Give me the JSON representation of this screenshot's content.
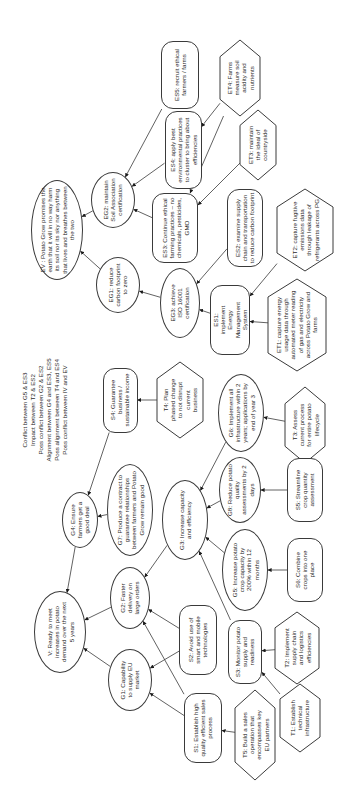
{
  "diagram": {
    "type": "goal-model",
    "orientation": "rotated-90-ccw",
    "nodes": [
      {
        "id": "EV",
        "shape": "ellipse",
        "text": "EV : Potato Grow promises the earth that it will in no way harm its soil nor its sky nor anything that lives and breathes between the two",
        "cx": 57,
        "cy": 230,
        "w": 52,
        "h": 100,
        "tw": 92
      },
      {
        "id": "EG2",
        "shape": "ellipse",
        "text": "EG2: maintain Soil Association certification",
        "cx": 113,
        "cy": 200,
        "w": 44,
        "h": 56,
        "tw": 48
      },
      {
        "id": "EG1",
        "shape": "ellipse",
        "text": "EG1: reduce carbon footprint to zero",
        "cx": 118,
        "cy": 285,
        "w": 44,
        "h": 56,
        "tw": 48
      },
      {
        "id": "ES5",
        "shape": "rrect",
        "text": "ES5: recruit ethical farmers / farms",
        "cx": 180,
        "cy": 75,
        "w": 38,
        "h": 68,
        "tw": 60
      },
      {
        "id": "ES4",
        "shape": "rrect",
        "text": "ES4: apply best environmental practices to cluster to bring about efficiencies",
        "cx": 183,
        "cy": 150,
        "w": 37,
        "h": 78,
        "tw": 70
      },
      {
        "id": "ES3",
        "shape": "rrect",
        "text": "ES3: Continue ethical farming practices – no chemicals, pesticides, GMO",
        "cx": 175,
        "cy": 228,
        "w": 46,
        "h": 70,
        "tw": 62
      },
      {
        "id": "ET4",
        "shape": "hex",
        "text": "ET4: Farms measure soil acidity and nutrients",
        "cx": 240,
        "cy": 78,
        "w": 40,
        "h": 76,
        "tw": 50
      },
      {
        "id": "ET3",
        "shape": "hex",
        "text": "ET3: maintain the ideal of countryside",
        "cx": 258,
        "cy": 145,
        "w": 36,
        "h": 70,
        "tw": 44
      },
      {
        "id": "ES2",
        "shape": "rrect",
        "text": "ES2: examine supply chain and transportation to reduce carbon footprint",
        "cx": 245,
        "cy": 228,
        "w": 36,
        "h": 78,
        "tw": 72
      },
      {
        "id": "ET2",
        "shape": "hex",
        "text": "ET2: capture fugitive emissions data through leakage of refrigerants across PG",
        "cx": 305,
        "cy": 230,
        "w": 56,
        "h": 82,
        "tw": 62
      },
      {
        "id": "EG3",
        "shape": "ellipse",
        "text": "EG3: achieve ISO 16001 certification",
        "cx": 180,
        "cy": 303,
        "w": 40,
        "h": 70,
        "tw": 40
      },
      {
        "id": "ES1",
        "shape": "rrect",
        "text": "ES1: implement Energy Management System",
        "cx": 230,
        "cy": 320,
        "w": 40,
        "h": 70,
        "tw": 40
      },
      {
        "id": "ET1",
        "shape": "hex",
        "text": "ET1: capture energy usage data through automated meter reading of gas and electricity across Potato Grow and farms",
        "cx": 297,
        "cy": 325,
        "w": 58,
        "h": 92,
        "tw": 72
      },
      {
        "id": "S4",
        "shape": "rrect",
        "text": "S4: Guarantee business / sustainable income",
        "cx": 120,
        "cy": 400,
        "w": 35,
        "h": 65,
        "tw": 58
      },
      {
        "id": "T4",
        "shape": "hex",
        "text": "T4: Plan phased change to not disrupt current business",
        "cx": 180,
        "cy": 400,
        "w": 46,
        "h": 76,
        "tw": 44
      },
      {
        "id": "G6",
        "shape": "ellipse",
        "text": "G6: Implement all infrastructure within 2 years; applications by end of year 3",
        "cx": 241,
        "cy": 413,
        "w": 46,
        "h": 78,
        "tw": 66
      },
      {
        "id": "T3",
        "shape": "hex",
        "text": "T3: Assess current process for entire potato lifecycle",
        "cx": 305,
        "cy": 425,
        "w": 40,
        "h": 76,
        "tw": 50
      },
      {
        "id": "G4",
        "shape": "ellipse",
        "text": "G4: Ensure farmers get a good deal",
        "cx": 80,
        "cy": 520,
        "w": 36,
        "h": 56,
        "tw": 38
      },
      {
        "id": "G7",
        "shape": "ellipse",
        "text": "G7: Produce a contract to guarantee relationships between farmers and Potato Grow remain good",
        "cx": 130,
        "cy": 510,
        "w": 46,
        "h": 92,
        "tw": 82
      },
      {
        "id": "G3",
        "shape": "ellipse",
        "text": "G3: Increase capacity and efficiency",
        "cx": 185,
        "cy": 520,
        "w": 46,
        "h": 80,
        "tw": 60
      },
      {
        "id": "G8",
        "shape": "ellipse",
        "text": "G8: Reduce potato quality assessments by 2 days",
        "cx": 240,
        "cy": 490,
        "w": 42,
        "h": 66,
        "tw": 52
      },
      {
        "id": "S5",
        "shape": "rrect",
        "text": "S5: Streamline crop quantity assessment",
        "cx": 305,
        "cy": 490,
        "w": 36,
        "h": 64,
        "tw": 46
      },
      {
        "id": "G5",
        "shape": "ellipse",
        "text": "G5: Increase potato crop capacity by 200% within 12 months",
        "cx": 245,
        "cy": 570,
        "w": 46,
        "h": 82,
        "tw": 60
      },
      {
        "id": "S6",
        "shape": "rrect",
        "text": "S6: Combine crops into one place",
        "cx": 305,
        "cy": 570,
        "w": 36,
        "h": 64,
        "tw": 40
      },
      {
        "id": "V",
        "shape": "ellipse",
        "text": "V: Ready to meet increases in potato demand over the next 5 years",
        "cx": 60,
        "cy": 632,
        "w": 52,
        "h": 82,
        "tw": 60
      },
      {
        "id": "G2",
        "shape": "ellipse",
        "text": "G2: Faster delivery on large orders",
        "cx": 130,
        "cy": 598,
        "w": 40,
        "h": 62,
        "tw": 42
      },
      {
        "id": "G1",
        "shape": "ellipse",
        "text": "G1: Capability to supply EU market",
        "cx": 130,
        "cy": 680,
        "w": 44,
        "h": 62,
        "tw": 44
      },
      {
        "id": "S2",
        "shape": "rrect",
        "text": "S2: Avoid use of smart and mobile technologies",
        "cx": 198,
        "cy": 640,
        "w": 38,
        "h": 70,
        "tw": 56
      },
      {
        "id": "S3",
        "shape": "rrect",
        "text": "S3: Monitor potato supply and readiness",
        "cx": 245,
        "cy": 652,
        "w": 34,
        "h": 64,
        "tw": 52
      },
      {
        "id": "T2",
        "shape": "hex",
        "text": "T2: Implement supply chain and logistics efficiencies",
        "cx": 297,
        "cy": 648,
        "w": 44,
        "h": 72,
        "tw": 46
      },
      {
        "id": "S1",
        "shape": "rrect",
        "text": "S1: Establish high quality efficient sales process",
        "cx": 203,
        "cy": 728,
        "w": 38,
        "h": 70,
        "tw": 58
      },
      {
        "id": "T5",
        "shape": "hex",
        "text": "T5: Build a sales operation that encompasses key EU partners",
        "cx": 255,
        "cy": 735,
        "w": 40,
        "h": 90,
        "tw": 56
      },
      {
        "id": "T1",
        "shape": "hex",
        "text": "T1: Establish technical infrastructure",
        "cx": 300,
        "cy": 718,
        "w": 40,
        "h": 68,
        "tw": 44
      }
    ],
    "edges": [
      {
        "from": "EG2",
        "to": "EV"
      },
      {
        "from": "EG1",
        "to": "EV"
      },
      {
        "from": "ES5",
        "to": "EG2"
      },
      {
        "from": "ES4",
        "to": "EG2"
      },
      {
        "from": "ES3",
        "to": "EG2"
      },
      {
        "from": "ET4",
        "to": "ES4"
      },
      {
        "from": "ET4",
        "to": "ES3"
      },
      {
        "from": "ET3",
        "to": "ES3"
      },
      {
        "from": "EG3",
        "to": "EG1"
      },
      {
        "from": "ES2",
        "to": "EG3"
      },
      {
        "from": "ES1",
        "to": "EG3"
      },
      {
        "from": "ET2",
        "to": "ES1"
      },
      {
        "from": "ET1",
        "to": "ES1"
      },
      {
        "from": "T4",
        "to": "S4"
      },
      {
        "from": "S4",
        "to": "G4"
      },
      {
        "from": "G7",
        "to": "G4"
      },
      {
        "from": "G4",
        "to": "V"
      },
      {
        "from": "T3",
        "to": "G6"
      },
      {
        "from": "G6",
        "to": "G3"
      },
      {
        "from": "G8",
        "to": "G3"
      },
      {
        "from": "S5",
        "to": "G8"
      },
      {
        "from": "G5",
        "to": "G3"
      },
      {
        "from": "S3",
        "to": "G3"
      },
      {
        "from": "S6",
        "to": "G5"
      },
      {
        "from": "G3",
        "to": "G2"
      },
      {
        "from": "G2",
        "to": "V"
      },
      {
        "from": "G1",
        "to": "V"
      },
      {
        "from": "S2",
        "to": "G2"
      },
      {
        "from": "S2",
        "to": "G1"
      },
      {
        "from": "S1",
        "to": "G2"
      },
      {
        "from": "S1",
        "to": "G1"
      },
      {
        "from": "T5",
        "to": "S1"
      },
      {
        "from": "T2",
        "to": "S3"
      },
      {
        "from": "T1",
        "to": "S3"
      }
    ],
    "notes": [
      "Conflict between G5 & ES3",
      "Impact between T2 & ES2",
      "Poss conflict between G2 & ES2",
      "Alignment between G4 and ES3, ES5",
      "Poss alignment between T4 and ES4",
      "Poss conflict between IV and EV"
    ]
  },
  "colors": {
    "line": "#3a3a3a",
    "text": "#2a2a2a",
    "background": "#ffffff"
  }
}
